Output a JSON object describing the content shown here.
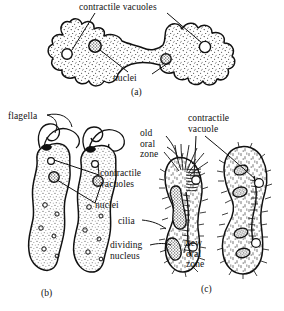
{
  "figure": {
    "background_color": "#ffffff",
    "ink_color": "#111111",
    "panels": [
      {
        "tag": "(a)",
        "organism": "amoeba",
        "labels": [
          {
            "key": "contractile_vacuoles",
            "text": "contractile vacuoles"
          },
          {
            "key": "nuclei",
            "text": "nuclei"
          }
        ]
      },
      {
        "tag": "(b)",
        "organism": "flagellate",
        "labels": [
          {
            "key": "flagella",
            "text": "flagella"
          },
          {
            "key": "contractile_vacuoles",
            "text": "contractile vacuoles"
          },
          {
            "key": "nuclei",
            "text": "nuclei"
          }
        ]
      },
      {
        "tag": "(c)",
        "organism": "ciliate",
        "labels": [
          {
            "key": "old_oral_zone",
            "text": "old oral zone"
          },
          {
            "key": "contractile_vacuole",
            "text": "contractile vacuole"
          },
          {
            "key": "cilia",
            "text": "cilia"
          },
          {
            "key": "dividing_nucleus",
            "text": "dividing nucleus"
          },
          {
            "key": "new_oral_zone",
            "text": "new oral zone"
          }
        ]
      }
    ]
  },
  "panel_a": {
    "tag": "(a)",
    "label_contractile_vacuoles": "contractile vacuoles",
    "label_nuclei": "nuclei"
  },
  "panel_b": {
    "tag": "(b)",
    "label_flagella": "flagella",
    "label_contractile_vacuoles": "contractile vacuoles",
    "label_nuclei": "nuclei"
  },
  "panel_c": {
    "tag": "(c)",
    "label_old_oral_zone": "old oral zone",
    "label_contractile_vacuole": "contractile vacuole",
    "label_cilia": "cilia",
    "label_dividing_nucleus": "dividing nucleus",
    "label_new_oral_zone": "new oral zone"
  }
}
